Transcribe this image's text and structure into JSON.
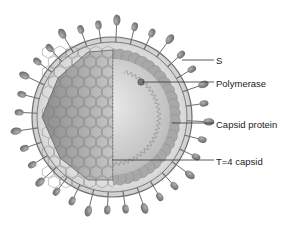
{
  "diagram": {
    "labels": [
      {
        "id": "s",
        "text": "S",
        "x": 216,
        "y": 55,
        "line": {
          "x1": 182,
          "y1": 60,
          "x2": 214,
          "y2": 60
        }
      },
      {
        "id": "polymerase",
        "text": "Polymerase",
        "x": 216,
        "y": 78,
        "line": {
          "x1": 142,
          "y1": 82,
          "x2": 214,
          "y2": 82
        }
      },
      {
        "id": "capsid-protein",
        "text": "Capsid protein",
        "x": 216,
        "y": 119,
        "line": {
          "x1": 172,
          "y1": 123,
          "x2": 214,
          "y2": 123
        }
      },
      {
        "id": "t4-capsid",
        "text": "T=4 capsid",
        "x": 216,
        "y": 156,
        "line": {
          "x1": 112,
          "y1": 160,
          "x2": 214,
          "y2": 160
        }
      }
    ],
    "colors": {
      "envelope_fill": "#dcdcdc",
      "membrane_line": "#6e6e6e",
      "spike_fill": "#8a8a8a",
      "capsid_fill": "#a9a9a9",
      "core_fill": "#d2d2d2",
      "leader_line": "#333333"
    }
  }
}
